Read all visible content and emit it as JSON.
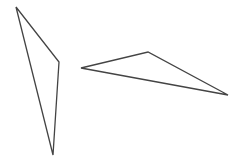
{
  "canvas": {
    "width": 239,
    "height": 163,
    "background": "#ffffff"
  },
  "stroke": {
    "color": "#444444",
    "width": 1.3
  },
  "shapes": [
    {
      "name": "left-triangle",
      "points": [
        [
          16,
          7
        ],
        [
          59,
          62
        ],
        [
          53,
          155
        ]
      ]
    },
    {
      "name": "right-triangle",
      "points": [
        [
          81,
          68
        ],
        [
          148,
          52
        ],
        [
          228,
          95
        ]
      ]
    }
  ]
}
